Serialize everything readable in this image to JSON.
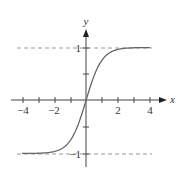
{
  "chart_data": {
    "type": "line",
    "title": "",
    "function": "y = tanh(x)",
    "xlabel": "x",
    "ylabel": "y",
    "xlim": [
      -4,
      4
    ],
    "ylim": [
      -1,
      1
    ],
    "x_ticks": [
      -4,
      -3,
      -2,
      -1,
      1,
      2,
      3,
      4
    ],
    "x_tick_labels": [
      "−4",
      "−2",
      "2",
      "4"
    ],
    "y_ticks": [
      -1,
      -0.5,
      0.5,
      1
    ],
    "y_tick_labels": [
      "1",
      "−1"
    ],
    "asymptotes": [
      1,
      -1
    ],
    "grid": false,
    "series": [
      {
        "name": "tanh(x)",
        "x": [
          -4,
          -3,
          -2,
          -1.5,
          -1,
          -0.5,
          0,
          0.5,
          1,
          1.5,
          2,
          3,
          4
        ],
        "values": [
          -0.999,
          -0.995,
          -0.964,
          -0.905,
          -0.762,
          -0.462,
          0,
          0.462,
          0.762,
          0.905,
          0.964,
          0.995,
          0.999
        ]
      }
    ],
    "colors": {
      "curve": "#555555",
      "axes": "#444444",
      "asymptote": "#999999"
    }
  },
  "labels": {
    "x_axis": "x",
    "y_axis": "y",
    "x_neg4": "−4",
    "x_neg2": "−2",
    "x_2": "2",
    "x_4": "4",
    "y_1": "1",
    "y_neg1": "−1"
  }
}
